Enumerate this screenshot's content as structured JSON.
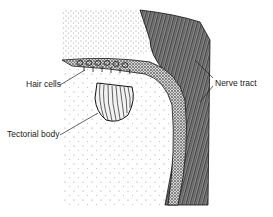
{
  "figure": {
    "type": "anatomical-illustration",
    "labels": {
      "hair_cells": "Hair cells",
      "tectorial_body": "Tectorial body",
      "nerve_tract": "Nerve tract"
    },
    "colors": {
      "ink": "#1a1a1a",
      "paper": "#ffffff"
    }
  }
}
